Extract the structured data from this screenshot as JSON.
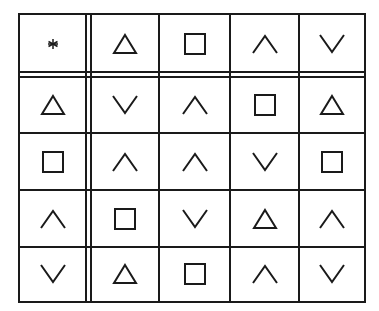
{
  "table": {
    "corner": "asterisk",
    "header_row": [
      "triangle",
      "square",
      "caret-up",
      "caret-down"
    ],
    "header_col": [
      "triangle",
      "square",
      "caret-up",
      "caret-down"
    ],
    "rows": [
      [
        "caret-down",
        "caret-up",
        "square",
        "triangle"
      ],
      [
        "caret-up",
        "caret-up",
        "caret-down",
        "square"
      ],
      [
        "square",
        "caret-down",
        "triangle",
        "caret-up"
      ],
      [
        "triangle",
        "square",
        "caret-up",
        "caret-down"
      ]
    ]
  },
  "colors": {
    "line": "#1a1a1a",
    "background": "#ffffff"
  }
}
